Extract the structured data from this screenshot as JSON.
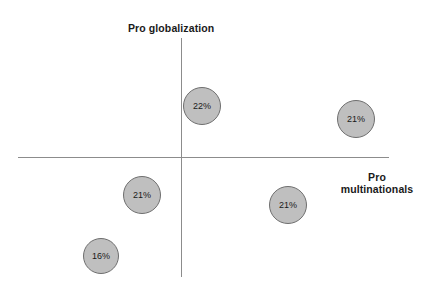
{
  "chart_data": {
    "type": "scatter",
    "title": "",
    "xlabel": "Pro multinationals",
    "ylabel": "Pro globalization",
    "grid": false,
    "legend": "none",
    "axis_style": "quadrant-crosshair",
    "xlim": [
      -1,
      1
    ],
    "ylim": [
      -1,
      1
    ],
    "note": "Bubble (balloon) quadrant map; bubble area encodes the labelled percentage.",
    "points": [
      {
        "label": "22%",
        "value": 22,
        "quadrant": "upper-left",
        "px": {
          "cx": 202,
          "cy": 106,
          "d": 38
        }
      },
      {
        "label": "21%",
        "value": 21,
        "quadrant": "upper-right",
        "px": {
          "cx": 356,
          "cy": 119,
          "d": 38
        }
      },
      {
        "label": "21%",
        "value": 21,
        "quadrant": "lower-left",
        "px": {
          "cx": 142,
          "cy": 195,
          "d": 38
        }
      },
      {
        "label": "21%",
        "value": 21,
        "quadrant": "lower-right",
        "px": {
          "cx": 288,
          "cy": 205,
          "d": 38
        }
      },
      {
        "label": "16%",
        "value": 16,
        "quadrant": "lower-left",
        "px": {
          "cx": 101,
          "cy": 256,
          "d": 36
        }
      }
    ],
    "colors": {
      "bubble_fill": "#bfbfbf",
      "bubble_stroke": "#6e6e6e",
      "axis": "#8c8c8c",
      "text": "#1a1a1a",
      "background": "#ffffff"
    }
  },
  "axes": {
    "y_title": "Pro globalization",
    "x_title_line1": "Pro",
    "x_title_line2": "multinationals"
  }
}
